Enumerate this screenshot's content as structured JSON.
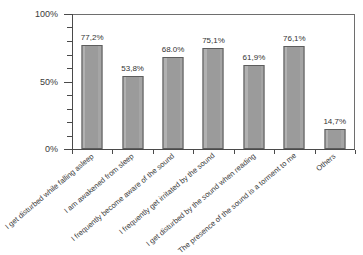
{
  "chart_data": {
    "type": "bar",
    "title": "",
    "xlabel": "",
    "ylabel": "",
    "ylim": [
      0,
      100
    ],
    "ytick_labels": [
      "0%",
      "50%",
      "100%"
    ],
    "ytick_values": [
      0,
      50,
      100
    ],
    "minor_tick_interval": 10,
    "grid": false,
    "legend": "none",
    "value_label_suffix": "%",
    "categories": [
      "I get disturbed while falling asleep",
      "I am awakened from sleep",
      "I frequently become aware of the sound",
      "I frequently get irritated by the sound",
      "I get disturbed by the sound when reading",
      "The presence of the sound is a torment to me",
      "Others"
    ],
    "values": [
      77.2,
      53.8,
      68.0,
      75.1,
      61.9,
      76.1,
      14.7
    ],
    "value_labels": [
      "77,2%",
      "53,8%",
      "68.0%",
      "75,1%",
      "61,9%",
      "76,1%",
      "14,7%"
    ],
    "colors": {
      "bar_fill": "#9b9b9b",
      "bar_border": "#5d5d5d",
      "axis": "#4a4a4a",
      "frame": "#6e6e6e",
      "text": "#333333",
      "background": "#ffffff"
    }
  }
}
